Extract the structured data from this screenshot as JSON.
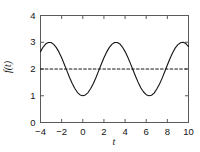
{
  "chart_data": {
    "type": "line",
    "title": "",
    "xlabel": "t",
    "ylabel": "f(t)",
    "xlim": [
      -4,
      10
    ],
    "ylim": [
      0,
      4
    ],
    "xticks": [
      -4,
      -2,
      0,
      2,
      4,
      6,
      8,
      10
    ],
    "xtick_labels": [
      "−4",
      "−2",
      "0",
      "2",
      "4",
      "6",
      "8",
      "10"
    ],
    "yticks": [
      0,
      1,
      2,
      3,
      4
    ],
    "ytick_labels": [
      "0",
      "1",
      "2",
      "3",
      "4"
    ],
    "grid": false,
    "legend": null,
    "series": [
      {
        "name": "f(t) = 2 - cos(t)",
        "style": "solid",
        "color": "#141414",
        "linewidth": 1.1,
        "expression": "2 - cos(t)",
        "x": [
          -4,
          -3.75,
          -3.5,
          -3.25,
          -3,
          -2.75,
          -2.5,
          -2.25,
          -2,
          -1.75,
          -1.5,
          -1.25,
          -1,
          -0.75,
          -0.5,
          -0.25,
          0,
          0.25,
          0.5,
          0.75,
          1,
          1.25,
          1.5,
          1.75,
          2,
          2.25,
          2.5,
          2.75,
          3,
          3.25,
          3.5,
          3.75,
          4,
          4.25,
          4.5,
          4.75,
          5,
          5.25,
          5.5,
          5.75,
          6,
          6.25,
          6.5,
          6.75,
          7,
          7.25,
          7.5,
          7.75,
          8,
          8.25,
          8.5,
          8.75,
          9,
          9.25,
          9.5,
          9.75,
          10
        ],
        "y": [
          2.65,
          2.82,
          2.94,
          2.99,
          2.99,
          2.92,
          2.8,
          2.63,
          2.42,
          2.18,
          1.93,
          1.68,
          1.46,
          1.27,
          1.12,
          1.03,
          1.0,
          1.03,
          1.12,
          1.27,
          1.46,
          1.68,
          1.93,
          2.18,
          2.42,
          2.63,
          2.8,
          2.92,
          2.99,
          2.99,
          2.94,
          2.82,
          2.65,
          2.45,
          2.21,
          1.96,
          1.72,
          1.49,
          1.29,
          1.14,
          1.04,
          1.0,
          1.02,
          1.1,
          1.25,
          1.43,
          1.65,
          1.9,
          2.15,
          2.39,
          2.61,
          2.79,
          2.91,
          2.98,
          3.0,
          2.95,
          2.84
        ]
      },
      {
        "name": "mean level",
        "style": "dashed",
        "color": "#141414",
        "linewidth": 1.1,
        "constant_y": 2,
        "x": [
          -4,
          10
        ],
        "y": [
          2,
          2
        ]
      }
    ]
  },
  "axes": {
    "frame_color": "#5a5a5a",
    "tick_direction": "in",
    "spines": [
      "left",
      "right",
      "top",
      "bottom"
    ]
  }
}
